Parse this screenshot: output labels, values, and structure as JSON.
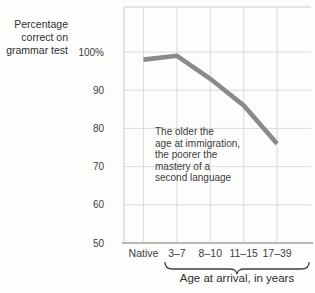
{
  "figure": {
    "y_axis_title": "Percentage\ncorrect on\ngrammar test",
    "annotation": "The older the\nage at immigration,\nthe poorer the\nmastery of a\nsecond language"
  },
  "chart_data": {
    "type": "line",
    "title": "",
    "xlabel": "Age at arrival, in years",
    "ylabel": "Percentage correct on grammar test",
    "categories": [
      "Native",
      "3–7",
      "8–10",
      "11–15",
      "17–39"
    ],
    "values": [
      98,
      99,
      93,
      86,
      76
    ],
    "ylim": [
      50,
      100
    ],
    "yticks": [
      {
        "label": "100%",
        "value": 100
      },
      {
        "label": "90",
        "value": 90
      },
      {
        "label": "80",
        "value": 80
      },
      {
        "label": "70",
        "value": 70
      },
      {
        "label": "60",
        "value": 60
      },
      {
        "label": "50",
        "value": 50
      }
    ],
    "grid": true,
    "legend": "none",
    "brace_span": [
      "3–7",
      "17–39"
    ],
    "colors": {
      "line": "#8a8a8a",
      "grid": "#d9dcd9",
      "axis": "#b5bab5",
      "text": "#3a3a3a",
      "brace": "#3f3f3f",
      "background": "#fdfdfb"
    }
  }
}
